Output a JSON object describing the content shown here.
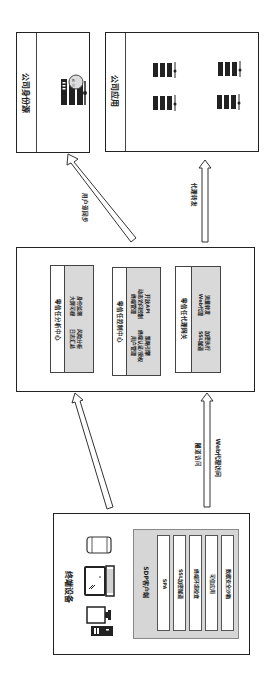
{
  "identity_source": {
    "title": "公司身份源",
    "icon": "identity-server-magnifier-icon"
  },
  "company_apps": {
    "title": "公司应用",
    "icons": [
      "server-rack-icon",
      "server-rack-icon",
      "server-rack-icon",
      "server-rack-icon"
    ]
  },
  "arrows": {
    "user_sync": "用户源同步",
    "proxy_forward": "代理转发",
    "tunnel_access": "隧道访问",
    "web_proxy_access": "Web代理访问"
  },
  "zero_trust": {
    "analysis_center": {
      "title": "零信任分析中心",
      "lines": [
        "日志汇总",
        "风险分析",
        "大屏可视",
        "身份监测"
      ]
    },
    "control_center": {
      "title": "零信任控制中心",
      "lines": [
        "用户管理",
        "终端认证/授权",
        "策略引擎",
        "终端管理",
        "动态访问控制",
        "开放API"
      ]
    },
    "proxy_gateway": {
      "title": "零信任代理网关",
      "lines": [
        "SSL隧道",
        "加密执行",
        "Web代理",
        "流量转发"
      ]
    }
  },
  "terminal": {
    "title": "终端设备",
    "devices": [
      "mobile-phone-icon",
      "laptop-icon",
      "desktop-computer-icon"
    ],
    "sdp_client": {
      "title": "SDP客户端",
      "items": [
        "SPA",
        "SSL加密隧道",
        "终端环境检查",
        "可信应用",
        "数据安全沙箱"
      ]
    }
  }
}
